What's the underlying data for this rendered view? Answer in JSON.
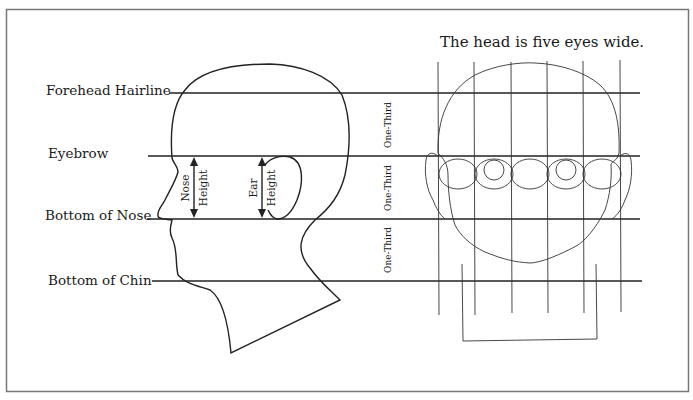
{
  "diagram": {
    "title": "The head is five eyes wide.",
    "guide_lines": [
      {
        "label": "Forehead Hairline",
        "y": 93
      },
      {
        "label": "Eyebrow",
        "y": 156
      },
      {
        "label": "Bottom of Nose",
        "y": 219
      },
      {
        "label": "Bottom of Chin",
        "y": 281
      }
    ],
    "section_labels": [
      "One-Third",
      "One-Third",
      "One-Third"
    ],
    "measurements": {
      "nose": [
        "Nose",
        "Height"
      ],
      "ear": [
        "Ear",
        "Height"
      ]
    },
    "eye_count": 5,
    "colors": {
      "line": "#222222",
      "frame": "#777777",
      "background": "#ffffff"
    }
  }
}
